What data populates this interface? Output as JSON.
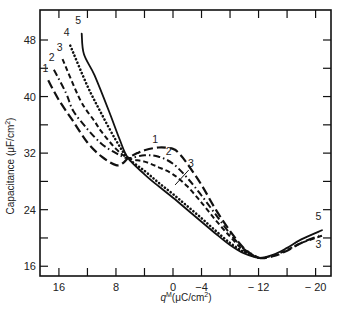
{
  "chart_data": {
    "type": "line",
    "title": "",
    "xlabel": "q^M(μC/cm²)",
    "xlabel_main": "q",
    "xlabel_sup": "M",
    "xlabel_unit": "(μC/cm",
    "xlabel_unit_sup": "2",
    "xlabel_unit_close": ")",
    "ylabel": "Capacitance (μF/cm²)",
    "ylabel_text": "Capacitance (μF/cm",
    "ylabel_sup": "2",
    "ylabel_close": ")",
    "xlim": [
      19,
      -22.2
    ],
    "ylim": [
      15,
      52
    ],
    "x_reversed": true,
    "grid": false,
    "legend": "inline curve numbers",
    "x_ticks": [
      16,
      12,
      8,
      4,
      0,
      -4,
      -8,
      -12,
      -16,
      -20
    ],
    "x_tick_labels": [
      {
        "value": 16,
        "label": "16"
      },
      {
        "value": 8,
        "label": "8"
      },
      {
        "value": 0,
        "label": "0"
      },
      {
        "value": -4,
        "label": "−4"
      },
      {
        "value": -12,
        "label": "− 12"
      },
      {
        "value": -20,
        "label": "− 20"
      }
    ],
    "y_ticks": [
      16,
      20,
      24,
      28,
      32,
      36,
      40,
      44,
      48
    ],
    "y_tick_labels": [
      {
        "value": 48,
        "label": "48"
      },
      {
        "value": 40,
        "label": "40"
      },
      {
        "value": 32,
        "label": "32"
      },
      {
        "value": 24,
        "label": "24"
      },
      {
        "value": 16,
        "label": "16"
      }
    ],
    "series": [
      {
        "name": "1",
        "style": "long-dash",
        "points": [
          [
            17.5,
            42.3
          ],
          [
            16,
            39.5
          ],
          [
            14,
            36.5
          ],
          [
            12,
            33.5
          ],
          [
            10,
            31.5
          ],
          [
            8,
            30.3
          ],
          [
            7,
            30.6
          ],
          [
            6.3,
            31.3
          ],
          [
            5,
            32.0
          ],
          [
            4,
            32.4
          ],
          [
            2,
            32.8
          ],
          [
            0,
            32.6
          ],
          [
            -1,
            31.8
          ],
          [
            -2,
            30.5
          ],
          [
            -4,
            27.5
          ],
          [
            -6,
            24.0
          ],
          [
            -8,
            21.0
          ],
          [
            -10,
            18.5
          ],
          [
            -12,
            17.2
          ],
          [
            -14,
            17.4
          ],
          [
            -16,
            18.2
          ],
          [
            -18,
            19.3
          ],
          [
            -20.5,
            20.3
          ]
        ]
      },
      {
        "name": "2",
        "style": "dash-dot",
        "points": [
          [
            16.7,
            43.8
          ],
          [
            15,
            40.5
          ],
          [
            14,
            38.0
          ],
          [
            12,
            35.4
          ],
          [
            10,
            33.3
          ],
          [
            8,
            32.0
          ],
          [
            6.3,
            31.3
          ],
          [
            4,
            31.7
          ],
          [
            2,
            31.5
          ],
          [
            0,
            30.5
          ],
          [
            -2,
            28.5
          ],
          [
            -4,
            26.0
          ],
          [
            -6,
            23.3
          ],
          [
            -8,
            20.6
          ],
          [
            -10,
            18.4
          ],
          [
            -12,
            17.2
          ]
        ]
      },
      {
        "name": "3",
        "style": "dashed",
        "points": [
          [
            15.5,
            45.3
          ],
          [
            13,
            39.5
          ],
          [
            11,
            36.5
          ],
          [
            10,
            35.0
          ],
          [
            8,
            32.6
          ],
          [
            6.3,
            31.3
          ],
          [
            4,
            30.8
          ],
          [
            2,
            30.0
          ],
          [
            0,
            29.0
          ],
          [
            -2,
            27.3
          ],
          [
            -4,
            25.0
          ],
          [
            -6,
            22.5
          ],
          [
            -8,
            20.2
          ],
          [
            -10,
            18.2
          ],
          [
            -12,
            17.2
          ],
          [
            -14,
            17.5
          ],
          [
            -16,
            18.3
          ],
          [
            -18,
            19.3
          ],
          [
            -20.9,
            20.3
          ]
        ]
      },
      {
        "name": "4",
        "style": "dotted",
        "points": [
          [
            14.4,
            47.2
          ],
          [
            12,
            41.5
          ],
          [
            10,
            37.5
          ],
          [
            8,
            33.8
          ],
          [
            6.3,
            31.3
          ],
          [
            4,
            29.5
          ],
          [
            2,
            27.8
          ],
          [
            0,
            26.2
          ],
          [
            -2,
            24.5
          ],
          [
            -4,
            22.8
          ],
          [
            -6,
            21.0
          ],
          [
            -8,
            19.3
          ],
          [
            -10,
            18.0
          ],
          [
            -12,
            17.2
          ]
        ]
      },
      {
        "name": "5",
        "style": "solid",
        "points": [
          [
            12.8,
            48.9
          ],
          [
            12.5,
            46.0
          ],
          [
            11,
            43.0
          ],
          [
            9,
            38.0
          ],
          [
            7.5,
            34.0
          ],
          [
            6.3,
            31.3
          ],
          [
            4,
            29.0
          ],
          [
            2,
            27.3
          ],
          [
            0,
            25.7
          ],
          [
            -2,
            24.0
          ],
          [
            -4,
            22.3
          ],
          [
            -6,
            20.6
          ],
          [
            -8,
            19.0
          ],
          [
            -10,
            17.8
          ],
          [
            -12,
            17.2
          ],
          [
            -14,
            17.6
          ],
          [
            -16,
            18.6
          ],
          [
            -18,
            19.8
          ],
          [
            -20.9,
            21.1
          ]
        ]
      }
    ],
    "annotations": [
      {
        "text": "1",
        "x": 17.9,
        "y": 43.5
      },
      {
        "text": "2",
        "x": 17.0,
        "y": 45.0
      },
      {
        "text": "3",
        "x": 15.9,
        "y": 46.5
      },
      {
        "text": "4",
        "x": 14.9,
        "y": 48.5
      },
      {
        "text": "5",
        "x": 13.3,
        "y": 50.2
      },
      {
        "text": "1",
        "x": 2.5,
        "y": 33.4
      },
      {
        "text": "2",
        "x": 0.6,
        "y": 31.7
      },
      {
        "text": "3",
        "x": -2.5,
        "y": 30.0
      },
      {
        "text": "5",
        "x": -20.4,
        "y": 22.6
      },
      {
        "text": "3",
        "x": -20.4,
        "y": 18.6
      }
    ],
    "curve3_leader": {
      "from": [
        -2.2,
        29.6
      ],
      "to": [
        -0.3,
        27.5
      ]
    }
  }
}
